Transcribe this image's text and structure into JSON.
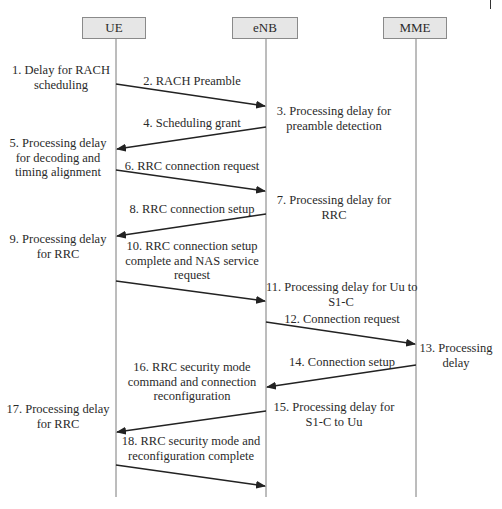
{
  "entities": [
    {
      "id": "ue",
      "label": "UE"
    },
    {
      "id": "enb",
      "label": "eNB"
    },
    {
      "id": "mme",
      "label": "MME"
    }
  ],
  "notes": {
    "n1": [
      "1. Delay for RACH",
      "scheduling"
    ],
    "n3": [
      "3. Processing delay for",
      "preamble detection"
    ],
    "n5": [
      "5. Processing delay",
      "for decoding and",
      "timing alignment"
    ],
    "n7": [
      "7. Processing delay for",
      "RRC"
    ],
    "n9": [
      "9. Processing delay",
      "for RRC"
    ],
    "n11": [
      "11. Processing delay for Uu to",
      "S1-C"
    ],
    "n13": [
      "13. Processing",
      "delay"
    ],
    "n15": [
      "15. Processing delay for",
      "S1-C to Uu"
    ],
    "n17": [
      "17. Processing delay",
      "for RRC"
    ]
  },
  "messages": {
    "m2": {
      "lines": [
        "2. RACH Preamble"
      ],
      "from": "UE",
      "to": "eNB"
    },
    "m4": {
      "lines": [
        "4. Scheduling grant"
      ],
      "from": "eNB",
      "to": "UE"
    },
    "m6": {
      "lines": [
        "6. RRC connection request"
      ],
      "from": "UE",
      "to": "eNB"
    },
    "m8": {
      "lines": [
        "8. RRC connection setup"
      ],
      "from": "eNB",
      "to": "UE"
    },
    "m10": {
      "lines": [
        "10. RRC connection setup",
        "complete and NAS service",
        "request"
      ],
      "from": "UE",
      "to": "eNB"
    },
    "m12": {
      "lines": [
        "12. Connection request"
      ],
      "from": "eNB",
      "to": "MME"
    },
    "m14": {
      "lines": [
        "14. Connection setup"
      ],
      "from": "MME",
      "to": "eNB"
    },
    "m16": {
      "lines": [
        "16. RRC security mode",
        "command and connection",
        "reconfiguration"
      ],
      "from": "eNB",
      "to": "UE"
    },
    "m18": {
      "lines": [
        "18. RRC security mode and",
        "reconfiguration complete"
      ],
      "from": "UE",
      "to": "eNB"
    }
  },
  "colors": {
    "entity_fill": "#e6e6e6",
    "entity_border": "#8a8a8a",
    "lifeline": "#7a7a7a",
    "arrow": "#222222",
    "text": "#2a2a2a"
  }
}
